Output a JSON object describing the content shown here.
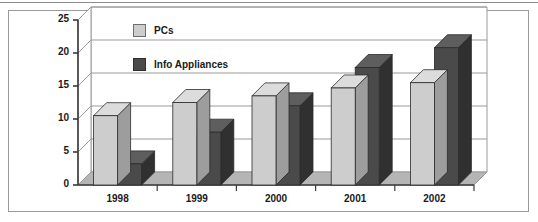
{
  "chart_data": {
    "type": "bar",
    "title": "",
    "subtitle": "",
    "xlabel": "",
    "ylabel": "",
    "categories": [
      "1998",
      "1999",
      "2000",
      "2001",
      "2002"
    ],
    "series": [
      {
        "name": "PCs",
        "values": [
          10.5,
          12.5,
          13.5,
          14.7,
          15.5
        ],
        "color": "#cdcdcd"
      },
      {
        "name": "Info Appliances",
        "values": [
          3.2,
          8.0,
          12.0,
          17.8,
          20.8
        ],
        "color": "#4a4a4a"
      }
    ],
    "ylim": [
      0,
      25
    ],
    "yticks": [
      0,
      5,
      10,
      15,
      20,
      25
    ],
    "ytick_labels": [
      "0",
      "5",
      "10",
      "15",
      "20",
      "25"
    ],
    "grid": true,
    "grid_axis": "y",
    "legend_position": "inside-top-left",
    "style": "3d-bar",
    "annotations": []
  },
  "legend": {
    "items": [
      {
        "label": "PCs",
        "swatch": "light-gray-swatch"
      },
      {
        "label": "Info Appliances",
        "swatch": "dark-gray-swatch"
      }
    ]
  },
  "colors": {
    "pcs_front": "#cdcdcd",
    "pcs_side": "#9d9d9d",
    "pcs_top": "#dcdcdc",
    "ia_front": "#4a4a4a",
    "ia_side": "#303030",
    "ia_top": "#5e5e5e",
    "axis": "#3a3a3a",
    "grid": "#9a9a9a",
    "frame": "#9a9a9a",
    "floor": "#b5b5b5",
    "text": "#1a1a1a"
  }
}
